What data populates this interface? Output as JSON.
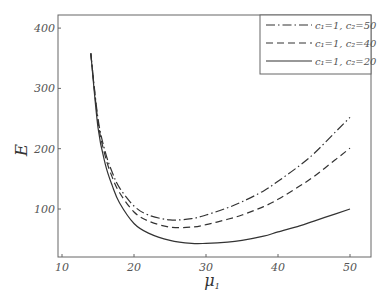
{
  "chart_data": {
    "type": "line",
    "title": "",
    "xlabel": "μ₁",
    "ylabel": "E",
    "xlim": [
      9,
      53
    ],
    "ylim": [
      20,
      420
    ],
    "xticks": [
      10,
      20,
      30,
      40,
      50
    ],
    "yticks": [
      100,
      200,
      300,
      400
    ],
    "grid": false,
    "legend_position": "upper right",
    "x": [
      14,
      15,
      16,
      17,
      18,
      20,
      22,
      25,
      28,
      30,
      33,
      35,
      38,
      40,
      43,
      45,
      48,
      50
    ],
    "series": [
      {
        "name": "c1=1, c2=50",
        "style": "dashdot",
        "values": [
          358,
          250,
          195,
          160,
          135,
          105,
          90,
          82,
          84,
          90,
          102,
          112,
          130,
          146,
          172,
          192,
          228,
          252
        ]
      },
      {
        "name": "c1=1, c2=40",
        "style": "dashed",
        "values": [
          358,
          245,
          188,
          152,
          127,
          95,
          80,
          70,
          70,
          74,
          83,
          90,
          104,
          116,
          138,
          154,
          182,
          201
        ]
      },
      {
        "name": "c1=1, c2=20",
        "style": "solid",
        "values": [
          358,
          235,
          175,
          138,
          110,
          76,
          60,
          48,
          43,
          43,
          45,
          48,
          55,
          62,
          72,
          80,
          92,
          100
        ]
      }
    ]
  },
  "legend": {
    "items": [
      {
        "label": "c₁=1, c₂=50"
      },
      {
        "label": "c₁=1, c₂=40"
      },
      {
        "label": "c₁=1, c₂=20"
      }
    ]
  },
  "axes": {
    "x_title": "μ",
    "x_sub": "1",
    "y_title": "E",
    "x_tick_labels": [
      "10",
      "20",
      "30",
      "40",
      "50"
    ],
    "y_tick_labels": [
      "100",
      "200",
      "300",
      "400"
    ]
  }
}
